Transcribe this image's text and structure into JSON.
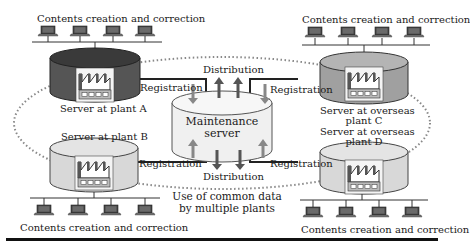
{
  "diagram": {
    "caption": "Use of common data by multiple plants",
    "caption_lines": [
      "Use of common data",
      "by multiple plants"
    ],
    "center": {
      "label_lines": [
        "Maintenance",
        "server"
      ],
      "fill": "#f0f0f0"
    },
    "flows": {
      "top_distribution": "Distribution",
      "bottom_distribution": "Distribution",
      "registration_a": "Registration",
      "registration_b": "Registration",
      "registration_c": "Registration",
      "registration_d": "Registration"
    },
    "plants": [
      {
        "id": "A",
        "label_lines": [
          "Server at plant A"
        ],
        "fill": "#555555",
        "clients_label": "Contents creation and correction"
      },
      {
        "id": "B",
        "label_lines": [
          "Server at plant B"
        ],
        "fill": "#d8d8d8",
        "clients_label": "Contents creation and correction"
      },
      {
        "id": "C",
        "label_lines": [
          "Server at overseas",
          "plant C"
        ],
        "fill": "#a0a0a0",
        "clients_label": "Contents creation and correction"
      },
      {
        "id": "D",
        "label_lines": [
          "Server at overseas",
          "plant D"
        ],
        "fill": "#d8d8d8",
        "clients_label": "Contents creation and correction"
      }
    ],
    "colors": {
      "line": "#222222",
      "dotted": "#888888",
      "arrow_up": "#555555",
      "arrow_down": "#888888"
    }
  }
}
